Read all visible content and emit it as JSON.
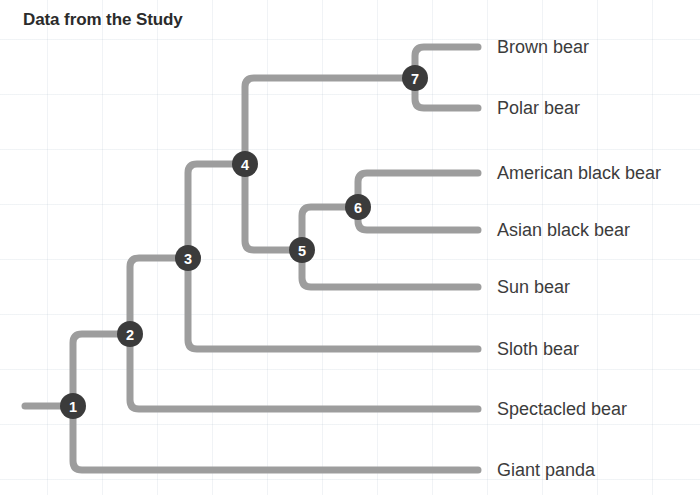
{
  "title": "Data from the Study",
  "colors": {
    "branch": "#9d9d9d",
    "node_fill": "#3b3b3b",
    "node_text": "#ffffff",
    "title_text": "#2b2b2b",
    "tip_text": "#3c3c3c",
    "background": "#ffffff",
    "grid": "#b0becd"
  },
  "chart_data": {
    "type": "diagram",
    "subtype": "cladogram",
    "title": "Data from the Study",
    "orientation": "left-to-right",
    "tips": [
      {
        "id": "brown-bear",
        "label": "Brown bear",
        "y": 47,
        "x_end": 478,
        "parent": "7"
      },
      {
        "id": "polar-bear",
        "label": "Polar bear",
        "y": 108,
        "x_end": 478,
        "parent": "7"
      },
      {
        "id": "american-black-bear",
        "label": "American black bear",
        "y": 173,
        "x_end": 478,
        "parent": "6"
      },
      {
        "id": "asian-black-bear",
        "label": "Asian black bear",
        "y": 230,
        "x_end": 478,
        "parent": "6"
      },
      {
        "id": "sun-bear",
        "label": "Sun bear",
        "y": 287,
        "x_end": 478,
        "parent": "5"
      },
      {
        "id": "sloth-bear",
        "label": "Sloth bear",
        "y": 349,
        "x_end": 478,
        "parent": "3"
      },
      {
        "id": "spectacled-bear",
        "label": "Spectacled bear",
        "y": 409,
        "x_end": 478,
        "parent": "2"
      },
      {
        "id": "giant-panda",
        "label": "Giant panda",
        "y": 470,
        "x_end": 478,
        "parent": "1"
      }
    ],
    "nodes": [
      {
        "id": "1",
        "label": "1",
        "x": 73,
        "y": 406,
        "children": [
          "2",
          "giant-panda"
        ]
      },
      {
        "id": "2",
        "label": "2",
        "x": 130,
        "y": 334,
        "children": [
          "3",
          "spectacled-bear"
        ]
      },
      {
        "id": "3",
        "label": "3",
        "x": 188,
        "y": 258,
        "children": [
          "4",
          "sloth-bear"
        ]
      },
      {
        "id": "4",
        "label": "4",
        "x": 245,
        "y": 164,
        "children": [
          "7",
          "5"
        ]
      },
      {
        "id": "5",
        "label": "5",
        "x": 302,
        "y": 250,
        "children": [
          "6",
          "sun-bear"
        ]
      },
      {
        "id": "6",
        "label": "6",
        "x": 358,
        "y": 207,
        "children": [
          "american-black-bear",
          "asian-black-bear"
        ]
      },
      {
        "id": "7",
        "label": "7",
        "x": 415,
        "y": 78,
        "children": [
          "brown-bear",
          "polar-bear"
        ]
      }
    ],
    "root_stub": {
      "x_start": 25,
      "x_end": 73,
      "y": 406
    },
    "node_radius": 13,
    "branch_width": 7,
    "corner_radius": 9
  }
}
